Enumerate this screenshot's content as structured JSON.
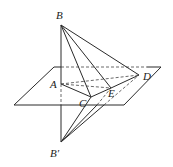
{
  "figure": {
    "points": {
      "B": {
        "label": "B",
        "x": 61,
        "y": 25
      },
      "Bp": {
        "label": "B′",
        "x": 61,
        "y": 142
      },
      "A": {
        "label": "A",
        "x": 61,
        "y": 84
      },
      "C": {
        "label": "C",
        "x": 91,
        "y": 97
      },
      "E": {
        "label": "E",
        "x": 111,
        "y": 88
      },
      "D": {
        "label": "D",
        "x": 139,
        "y": 75
      }
    },
    "plane": {
      "corners": [
        [
          54,
          67
        ],
        [
          161,
          67
        ],
        [
          124,
          105
        ],
        [
          14,
          105
        ]
      ]
    },
    "labels": {
      "B": "B",
      "Bp": "B′",
      "A": "A",
      "C": "C",
      "E": "E",
      "D": "D"
    }
  }
}
